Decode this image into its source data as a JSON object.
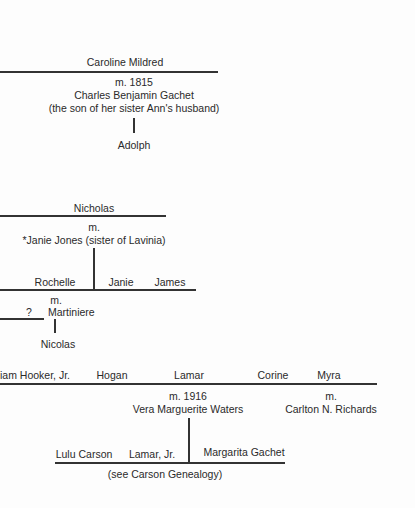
{
  "caroline_branch": {
    "name": "Caroline Mildred",
    "marriage": "m. 1815",
    "spouse": "Charles Benjamin Gachet",
    "spouse_note": "(the son of her sister Ann's husband)",
    "child": "Adolph"
  },
  "nicholas_branch": {
    "name": "Nicholas",
    "marriage": "m.",
    "spouse": "*Janie Jones (sister of Lavinia)",
    "children": [
      "Rochelle",
      "Janie",
      "James"
    ],
    "rochelle_marriage": "m.",
    "rochelle_spouse": "Martiniere",
    "unknown": "?",
    "grandchild": "Nicolas"
  },
  "lamar_generation": {
    "siblings": [
      "iam Hooker, Jr.",
      "Hogan",
      "Lamar",
      "Corine",
      "Myra"
    ],
    "lamar_marriage": "m. 1916",
    "lamar_spouse": "Vera Marguerite Waters",
    "myra_marriage": "m.",
    "myra_spouse": "Carlton N. Richards",
    "children": [
      "Lulu Carson",
      "Lamar, Jr.",
      "Margarita Gachet"
    ],
    "note": "(see Carson Genealogy)"
  }
}
